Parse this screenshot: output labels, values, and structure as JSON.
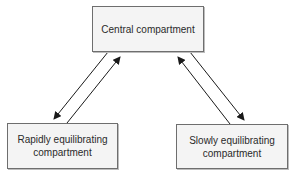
{
  "diagram": {
    "type": "compartment-model",
    "nodes": {
      "central": {
        "line1": "Central compartment",
        "line2": ""
      },
      "rapid": {
        "line1": "Rapidly equilibrating",
        "line2": "compartment"
      },
      "slow": {
        "line1": "Slowly equilibrating",
        "line2": "compartment"
      }
    },
    "edges": [
      {
        "from": "central",
        "to": "rapid"
      },
      {
        "from": "rapid",
        "to": "central"
      },
      {
        "from": "central",
        "to": "slow"
      },
      {
        "from": "slow",
        "to": "central"
      }
    ],
    "colors": {
      "box_fill": "#f4f4f4",
      "box_border": "#6e6e6e",
      "arrow": "#1a1a1a",
      "text": "#2a2a2a"
    }
  }
}
